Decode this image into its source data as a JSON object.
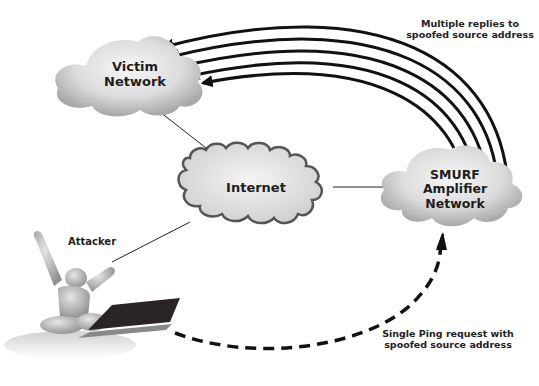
{
  "diagram": {
    "nodes": {
      "victim": {
        "line1": "Victim",
        "line2": "Network"
      },
      "internet": {
        "label": "Internet"
      },
      "amplifier": {
        "line1": "SMURF",
        "line2": "Amplifier",
        "line3": "Network"
      },
      "attacker": {
        "label": "Attacker"
      }
    },
    "annotations": {
      "replies": {
        "line1": "Multiple replies to",
        "line2": "spoofed source address"
      },
      "request": {
        "line1": "Single Ping request with",
        "line2": "spoofed source address"
      }
    },
    "edges": [
      {
        "from": "victim",
        "to": "internet",
        "style": "solid-thin"
      },
      {
        "from": "internet",
        "to": "amplifier",
        "style": "solid-thin"
      },
      {
        "from": "attacker",
        "to": "internet",
        "style": "solid-thin"
      },
      {
        "from": "attacker",
        "to": "amplifier",
        "style": "dashed-arrow",
        "label": "Single Ping request with spoofed source address"
      },
      {
        "from": "amplifier",
        "to": "victim",
        "style": "solid-arrow",
        "count": 5,
        "label": "Multiple replies to spoofed source address"
      }
    ],
    "colors": {
      "line": "#111111",
      "cloud_light": "#f2f2f2",
      "cloud_dark": "#a9a9a9",
      "internet_border": "#555555"
    }
  }
}
